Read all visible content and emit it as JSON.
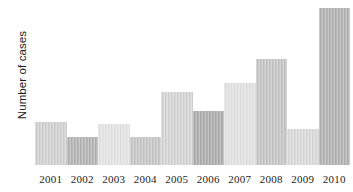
{
  "chart_data": {
    "type": "bar",
    "title": "",
    "subtitle": "",
    "xlabel": "",
    "ylabel": "Number of cases",
    "categories": [
      "2001",
      "2002",
      "2003",
      "2004",
      "2005",
      "2006",
      "2007",
      "2008",
      "2009",
      "2010"
    ],
    "values": [
      26,
      17,
      25,
      17,
      44,
      33,
      50,
      64,
      22,
      95
    ],
    "ylim": [
      0,
      100
    ],
    "grid": false,
    "legend": false,
    "legend_position": "none",
    "axis_tick_labels_x": [
      "2001",
      "2002",
      "2003",
      "2004",
      "2005",
      "2006",
      "2007",
      "2008",
      "2009",
      "2010"
    ],
    "axis_tick_labels_y": [],
    "bar_colors": [
      "#cfcfcf",
      "#b2b2b2",
      "#e2e2e2",
      "#c5c5c5",
      "#d2d2d2",
      "#aaaaaa",
      "#e0e0e0",
      "#c3c3c3",
      "#d8d8d8",
      "#b0b0b0"
    ],
    "background_color": "#ffffff",
    "text_color": "#232323"
  }
}
